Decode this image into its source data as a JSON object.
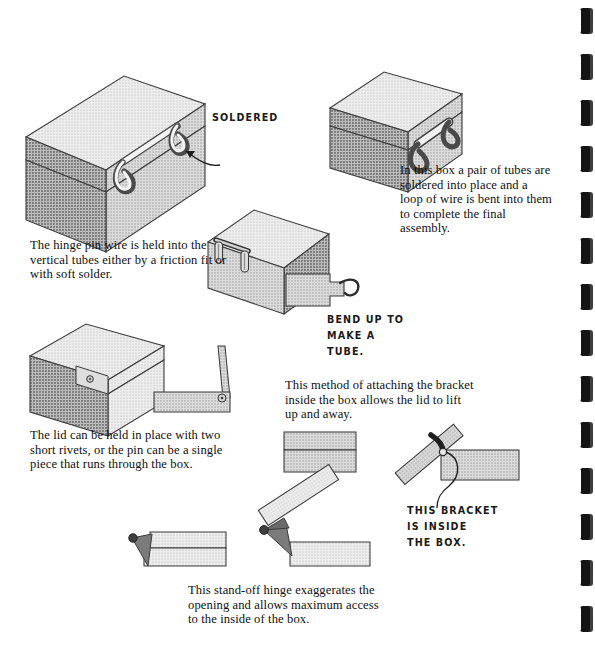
{
  "page": {
    "kind": "scanned-book-page",
    "topic": "Sheet metal box hinge construction methods",
    "background_color": "#ffffff",
    "binding": {
      "name": "spiral-binding-holes",
      "edge": "right",
      "hole_count": 14,
      "hole_color": "#141414",
      "first_hole_y": 8,
      "hole_spacing": 46
    }
  },
  "palette": {
    "ink": "#101010",
    "outline": "#3a3a3a",
    "metal_light": "#e9e9e9",
    "metal_mid": "#cfcfcf",
    "metal_shade": "#a9a9a9",
    "metal_dark": "#8a8a8a",
    "bracket_dark": "#6f6f6f",
    "wire": "#f2f2f2"
  },
  "captions": [
    {
      "id": "soldered-tubes-caption",
      "text": "In this box a pair of tubes are soldered into place and a loop of wire is bent into them to complete the final assembly.",
      "x": 400,
      "y": 163,
      "width": 150,
      "align": "left"
    },
    {
      "id": "hinge-pin-caption",
      "text": "The hinge pin wire is held into the vertical tubes either by a friction fit or with soft solder.",
      "x": 30,
      "y": 238,
      "width": 200,
      "align": "left"
    },
    {
      "id": "lid-rivets-caption",
      "text": "The lid can be held in place with two short rivets, or the pin can be a single piece that runs through the box.",
      "x": 30,
      "y": 428,
      "width": 205,
      "align": "left"
    },
    {
      "id": "bracket-method-caption",
      "text": "This method of attaching the bracket inside the box allows the lid to lift up and away.",
      "x": 285,
      "y": 378,
      "width": 190,
      "align": "left"
    },
    {
      "id": "stand-off-hinge-caption",
      "text": "This stand-off hinge exaggerates the opening and allows maximum access to the inside of the box.",
      "x": 188,
      "y": 583,
      "width": 200,
      "align": "left"
    }
  ],
  "annotations": [
    {
      "id": "soldered-label",
      "lines": [
        "SOLDERED"
      ],
      "x": 212,
      "y": 110
    },
    {
      "id": "bend-up-label",
      "lines": [
        "BEND UP TO",
        "MAKE A",
        "TUBE."
      ],
      "x": 327,
      "y": 312
    },
    {
      "id": "this-bracket-label",
      "lines": [
        "THIS BRACKET",
        "IS  INSIDE",
        "THE BOX."
      ],
      "x": 407,
      "y": 503
    }
  ],
  "illustrations": [
    {
      "id": "box-wire-loop-large",
      "name": "box-with-soldered-wire-loop-large",
      "description": "Large isometric closed box with lid seam and a bent wire loop hinge on the front face, arrow pointing to solder joint.",
      "x": 28,
      "y": 48,
      "width": 200,
      "height": 150
    },
    {
      "id": "box-wire-loop-small",
      "name": "box-with-tube-pair-hinge",
      "description": "Smaller isometric closed box with a pair of tubes and wire loop hinge on the front face.",
      "x": 330,
      "y": 62,
      "width": 130,
      "height": 105
    },
    {
      "id": "box-vertical-tubes",
      "name": "box-with-vertical-hinge-tubes",
      "description": "Isometric box viewed from above showing two vertical tubes and hinge pin wire across the back edge.",
      "x": 203,
      "y": 208,
      "width": 125,
      "height": 95
    },
    {
      "id": "tab-bend-up",
      "name": "flat-tab-with-curled-tongue",
      "description": "Flat sheet metal tab with a narrow tongue curled into a hook to form a tube.",
      "x": 286,
      "y": 268,
      "width": 75,
      "height": 42
    },
    {
      "id": "box-riveted-lid",
      "name": "box-with-riveted-lid-hinge",
      "description": "Isometric box with lifted lid edge and a riveted hinge flap on the corner.",
      "x": 30,
      "y": 322,
      "width": 150,
      "height": 100
    },
    {
      "id": "rivet-flap-detail",
      "name": "rivet-hinge-flap-detail",
      "description": "Side detail of a flat plate with an upright flap joined by a rivet.",
      "x": 150,
      "y": 345,
      "width": 95,
      "height": 75
    },
    {
      "id": "bracket-inside-closed",
      "name": "inside-bracket-hinge-closed",
      "description": "Side view of a box section with an internal bracket, lid closed.",
      "x": 282,
      "y": 430,
      "width": 80,
      "height": 45
    },
    {
      "id": "bracket-inside-open",
      "name": "inside-bracket-hinge-open",
      "description": "Side view of a box section with an internal bracket, lid lifted up and away, with a curved leader line to the handwritten note.",
      "x": 400,
      "y": 398,
      "width": 150,
      "height": 105
    },
    {
      "id": "stand-off-closed",
      "name": "stand-off-hinge-closed",
      "description": "Side view of a stand-off hinge in the closed position with a dark triangular bracket.",
      "x": 128,
      "y": 528,
      "width": 105,
      "height": 45
    },
    {
      "id": "stand-off-open",
      "name": "stand-off-hinge-open",
      "description": "Side view of a stand-off hinge with the lid swung fully open and away.",
      "x": 248,
      "y": 500,
      "width": 125,
      "height": 75
    }
  ]
}
